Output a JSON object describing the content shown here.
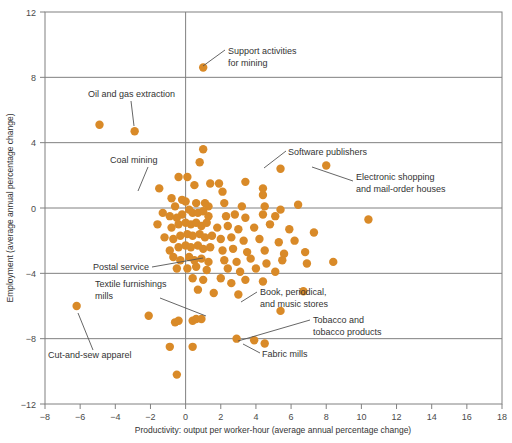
{
  "chart_data": {
    "type": "scatter",
    "title": "",
    "xlabel": "Productivity: output per worker-hour (average annual percentage change)",
    "ylabel": "Employment (average annual percentage change)",
    "xlim": [
      -8,
      18
    ],
    "ylim": [
      -12,
      12
    ],
    "xticks": [
      -8,
      -6,
      -4,
      -2,
      0,
      2,
      4,
      6,
      8,
      10,
      12,
      14,
      16,
      18
    ],
    "xtick_labels": [
      "−8",
      "−6",
      "−4",
      "−2",
      "0",
      "2",
      "4",
      "6",
      "8",
      "10",
      "12",
      "14",
      "16",
      "18"
    ],
    "yticks": [
      -12,
      -8,
      -4,
      0,
      4,
      8,
      12
    ],
    "ytick_labels": [
      "−12",
      "−8",
      "−4",
      "0",
      "4",
      "8",
      "12"
    ],
    "gridlines_y": [
      8,
      4,
      0,
      -4,
      -8
    ],
    "gridlines_x": [
      0
    ],
    "grid": true,
    "legend": "none",
    "marker_color": "#d98a28",
    "marker_size": 4.2,
    "points": [
      [
        1.0,
        8.6
      ],
      [
        -4.9,
        5.1
      ],
      [
        -2.9,
        4.7
      ],
      [
        1.0,
        3.6
      ],
      [
        0.8,
        2.8
      ],
      [
        5.4,
        2.4
      ],
      [
        8.0,
        2.6
      ],
      [
        -1.5,
        1.2
      ],
      [
        -0.4,
        1.9
      ],
      [
        0.1,
        1.9
      ],
      [
        0.5,
        1.4
      ],
      [
        1.4,
        1.5
      ],
      [
        1.9,
        1.5
      ],
      [
        3.4,
        1.6
      ],
      [
        4.4,
        1.2
      ],
      [
        4.4,
        0.8
      ],
      [
        2.1,
        1.0
      ],
      [
        -0.8,
        0.6
      ],
      [
        -0.6,
        0.1
      ],
      [
        -0.2,
        0.5
      ],
      [
        0.0,
        0.4
      ],
      [
        0.6,
        0.3
      ],
      [
        1.1,
        0.3
      ],
      [
        1.3,
        0.1
      ],
      [
        2.2,
        0.3
      ],
      [
        3.2,
        0.1
      ],
      [
        4.5,
        0.1
      ],
      [
        5.4,
        -0.1
      ],
      [
        6.4,
        0.2
      ],
      [
        0.2,
        -0.1
      ],
      [
        0.4,
        -0.3
      ],
      [
        0.7,
        -0.3
      ],
      [
        1.0,
        -0.2
      ],
      [
        1.3,
        -0.5
      ],
      [
        -0.2,
        -0.4
      ],
      [
        -0.5,
        -0.6
      ],
      [
        -0.9,
        -0.5
      ],
      [
        -1.3,
        -0.3
      ],
      [
        2.3,
        -0.5
      ],
      [
        2.8,
        -0.4
      ],
      [
        3.4,
        -0.6
      ],
      [
        4.4,
        -0.4
      ],
      [
        5.1,
        -0.5
      ],
      [
        10.4,
        -0.7
      ],
      [
        0.0,
        -0.9
      ],
      [
        0.3,
        -1.0
      ],
      [
        0.6,
        -0.9
      ],
      [
        0.9,
        -1.1
      ],
      [
        1.2,
        -0.9
      ],
      [
        -0.4,
        -1.0
      ],
      [
        -0.8,
        -1.2
      ],
      [
        -1.6,
        -1.0
      ],
      [
        1.8,
        -1.2
      ],
      [
        2.4,
        -1.1
      ],
      [
        3.0,
        -1.3
      ],
      [
        3.9,
        -1.2
      ],
      [
        4.8,
        -1.0
      ],
      [
        5.9,
        -1.3
      ],
      [
        7.3,
        -1.5
      ],
      [
        0.1,
        -1.6
      ],
      [
        0.4,
        -1.7
      ],
      [
        0.8,
        -1.6
      ],
      [
        1.1,
        -1.8
      ],
      [
        1.5,
        -1.7
      ],
      [
        -0.3,
        -1.7
      ],
      [
        -0.7,
        -1.9
      ],
      [
        -1.2,
        -1.8
      ],
      [
        2.0,
        -1.9
      ],
      [
        2.6,
        -1.8
      ],
      [
        3.3,
        -2.0
      ],
      [
        4.2,
        -1.9
      ],
      [
        5.3,
        -2.1
      ],
      [
        6.2,
        -2.0
      ],
      [
        0.0,
        -2.3
      ],
      [
        0.3,
        -2.4
      ],
      [
        0.7,
        -2.3
      ],
      [
        1.0,
        -2.5
      ],
      [
        1.4,
        -2.4
      ],
      [
        -0.4,
        -2.4
      ],
      [
        -0.9,
        -2.6
      ],
      [
        2.1,
        -2.6
      ],
      [
        2.7,
        -2.5
      ],
      [
        3.5,
        -2.7
      ],
      [
        4.5,
        -2.6
      ],
      [
        5.6,
        -2.8
      ],
      [
        6.8,
        -2.7
      ],
      [
        0.2,
        -3.0
      ],
      [
        0.5,
        -3.2
      ],
      [
        0.9,
        -3.1
      ],
      [
        1.3,
        -3.3
      ],
      [
        -0.3,
        -3.2
      ],
      [
        -0.7,
        -3.0
      ],
      [
        2.2,
        -3.2
      ],
      [
        2.9,
        -3.3
      ],
      [
        3.7,
        -3.1
      ],
      [
        4.6,
        -3.4
      ],
      [
        5.5,
        -3.2
      ],
      [
        6.9,
        -3.4
      ],
      [
        8.4,
        -3.3
      ],
      [
        0.1,
        -3.7
      ],
      [
        0.6,
        -3.6
      ],
      [
        1.2,
        -3.8
      ],
      [
        -0.5,
        -3.7
      ],
      [
        2.4,
        -3.7
      ],
      [
        3.1,
        -3.9
      ],
      [
        4.0,
        -3.7
      ],
      [
        5.1,
        -3.9
      ],
      [
        0.4,
        -4.3
      ],
      [
        1.0,
        -4.4
      ],
      [
        2.0,
        -4.3
      ],
      [
        2.6,
        -4.6
      ],
      [
        3.4,
        -4.4
      ],
      [
        4.4,
        -4.5
      ],
      [
        0.7,
        -5.0
      ],
      [
        1.6,
        -5.2
      ],
      [
        3.0,
        -5.3
      ],
      [
        6.7,
        -5.1
      ],
      [
        -6.2,
        -6.0
      ],
      [
        -2.1,
        -6.6
      ],
      [
        -0.6,
        -7.0
      ],
      [
        -0.4,
        -6.9
      ],
      [
        0.4,
        -6.9
      ],
      [
        0.6,
        -6.8
      ],
      [
        0.9,
        -6.8
      ],
      [
        5.4,
        -6.3
      ],
      [
        2.9,
        -8.0
      ],
      [
        3.9,
        -8.1
      ],
      [
        4.5,
        -8.3
      ],
      [
        -0.9,
        -8.5
      ],
      [
        0.4,
        -8.5
      ],
      [
        -0.5,
        -10.2
      ]
    ],
    "annotations": [
      {
        "name": "support-activities-for-mining",
        "text_lines": [
          "Support activities",
          "for mining"
        ],
        "text_x": 228,
        "text_y": 54,
        "text_anchor": "start",
        "leader": [
          [
            225,
            50
          ],
          [
            203,
            66
          ]
        ],
        "point": [
          1.0,
          8.6
        ]
      },
      {
        "name": "oil-and-gas-extraction",
        "text_lines": [
          "Oil and gas extraction"
        ],
        "text_x": 88,
        "text_y": 97,
        "text_anchor": "start",
        "leader": [
          [
            131,
            101
          ],
          [
            134,
            126
          ]
        ],
        "point": [
          -2.9,
          4.7
        ]
      },
      {
        "name": "coal-mining",
        "text_lines": [
          "Coal mining"
        ],
        "text_x": 110,
        "text_y": 163,
        "text_anchor": "start",
        "leader": [
          [
            148,
            167
          ],
          [
            138,
            191
          ]
        ],
        "point": [
          -1.5,
          1.2
        ]
      },
      {
        "name": "software-publishers",
        "text_lines": [
          "Software publishers"
        ],
        "text_x": 288,
        "text_y": 155,
        "text_anchor": "start",
        "leader": [
          [
            286,
            151
          ],
          [
            264,
            168
          ]
        ],
        "point": [
          5.4,
          2.4
        ]
      },
      {
        "name": "electronic-shopping-and-mail-order-houses",
        "text_lines": [
          "Electronic shopping",
          "and mail-order houses"
        ],
        "text_x": 356,
        "text_y": 180,
        "text_anchor": "start",
        "leader": [
          [
            353,
            181
          ],
          [
            312,
            167
          ]
        ],
        "point": [
          8.0,
          2.6
        ]
      },
      {
        "name": "postal-service",
        "text_lines": [
          "Postal service"
        ],
        "text_x": 93,
        "text_y": 270,
        "text_anchor": "start",
        "leader": [
          [
            152,
            267
          ],
          [
            203,
            258
          ]
        ],
        "point": [
          0.2,
          -3.0
        ]
      },
      {
        "name": "textile-furnishings-mills",
        "text_lines": [
          "Textile furnishings",
          "mills"
        ],
        "text_x": 95,
        "text_y": 287,
        "text_anchor": "start",
        "leader": [
          [
            160,
            298
          ],
          [
            206,
            316
          ]
        ],
        "point": [
          -0.6,
          -7.0
        ]
      },
      {
        "name": "book-periodical-and-music-stores",
        "text_lines": [
          "Book, periodical,",
          "and music stores"
        ],
        "text_x": 260,
        "text_y": 295,
        "text_anchor": "start",
        "leader": [
          [
            257,
            292
          ],
          [
            241,
            302
          ]
        ],
        "point": [
          5.4,
          -6.3
        ]
      },
      {
        "name": "tobacco-and-tobacco-products",
        "text_lines": [
          "Tobacco and",
          "tobacco products"
        ],
        "text_x": 313,
        "text_y": 323,
        "text_anchor": "start",
        "leader": [
          [
            310,
            320
          ],
          [
            238,
            341
          ]
        ],
        "point": [
          3.9,
          -8.1
        ]
      },
      {
        "name": "fabric-mills",
        "text_lines": [
          "Fabric mills"
        ],
        "text_x": 262,
        "text_y": 357,
        "text_anchor": "start",
        "leader": [
          [
            260,
            353
          ],
          [
            243,
            344
          ]
        ],
        "point": [
          2.9,
          -8.0
        ]
      },
      {
        "name": "cut-and-sew-apparel",
        "text_lines": [
          "Cut-and-sew apparel"
        ],
        "text_x": 48,
        "text_y": 358,
        "text_anchor": "start",
        "leader": [
          [
            93,
            350
          ],
          [
            78,
            313
          ]
        ],
        "point": [
          -6.2,
          -6.0
        ]
      }
    ]
  },
  "plot_geometry": {
    "left": 45,
    "top": 12,
    "right": 502,
    "bottom": 404
  },
  "colors": {
    "marker": "#d98a28",
    "axis": "#808080",
    "text": "#333333",
    "leader": "#555555",
    "background": "#ffffff"
  }
}
